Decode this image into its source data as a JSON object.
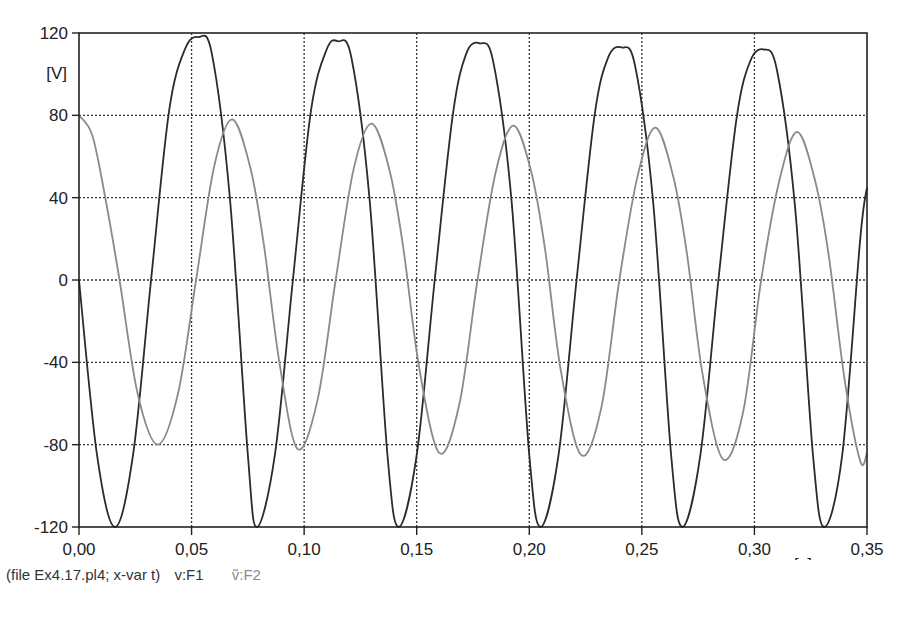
{
  "chart_data": {
    "type": "line",
    "title": "",
    "xlabel": "[s]",
    "ylabel": "[V]",
    "xlim": [
      0,
      0.35
    ],
    "ylim": [
      -120,
      120
    ],
    "grid": true,
    "grid_style": "dotted",
    "x_ticks": [
      0.0,
      0.05,
      0.1,
      0.15,
      0.2,
      0.25,
      0.3,
      0.35
    ],
    "x_tick_labels": [
      "0,00",
      "0,05",
      "0,10",
      "0,15",
      "0,20",
      "0,25",
      "0,30",
      "0,35"
    ],
    "y_ticks": [
      120,
      80,
      40,
      0,
      -40,
      -80,
      -120
    ],
    "y_tick_labels": [
      "120",
      "80",
      "40",
      "0",
      "-40",
      "-80",
      "-120"
    ],
    "legend_position": "bottom-left caption",
    "series": [
      {
        "name": "v:F1",
        "color": "#2b2b2b",
        "description": "sinusoid ~16 Hz starting at 0 going negative, amplitude ~118 V decaying slightly to ~112 V",
        "peaks": [
          [
            0.053,
            118
          ],
          [
            0.115,
            116
          ],
          [
            0.178,
            115
          ],
          [
            0.241,
            113
          ],
          [
            0.304,
            112
          ]
        ],
        "troughs": [
          [
            0.016,
            -120
          ],
          [
            0.079,
            -120
          ],
          [
            0.142,
            -120
          ],
          [
            0.205,
            -120
          ],
          [
            0.268,
            -120
          ],
          [
            0.331,
            -120
          ]
        ],
        "x": [
          0.0,
          0.008,
          0.016,
          0.024,
          0.032,
          0.04,
          0.047,
          0.053,
          0.059,
          0.067,
          0.075,
          0.079,
          0.087,
          0.095,
          0.103,
          0.11,
          0.115,
          0.121,
          0.129,
          0.137,
          0.142,
          0.15,
          0.158,
          0.166,
          0.172,
          0.178,
          0.184,
          0.192,
          0.2,
          0.205,
          0.213,
          0.221,
          0.229,
          0.235,
          0.241,
          0.247,
          0.255,
          0.263,
          0.268,
          0.276,
          0.284,
          0.292,
          0.298,
          0.304,
          0.31,
          0.318,
          0.326,
          0.331,
          0.339,
          0.347,
          0.35
        ],
        "values": [
          0,
          -85,
          -120,
          -85,
          0,
          82,
          112,
          118,
          110,
          40,
          -85,
          -120,
          -85,
          0,
          82,
          112,
          116,
          108,
          40,
          -85,
          -120,
          -85,
          0,
          80,
          110,
          115,
          106,
          40,
          -85,
          -120,
          -85,
          0,
          80,
          108,
          113,
          104,
          38,
          -85,
          -120,
          -85,
          0,
          78,
          106,
          112,
          102,
          36,
          -85,
          -120,
          -85,
          20,
          45
        ]
      },
      {
        "name": "v:F2",
        "color": "#8a8a8a",
        "description": "sinusoid ~16 Hz starting at +80 (cosine-like), peaks ~78→72 V, troughs ~-80→-88 V",
        "peaks": [
          [
            0.0,
            80
          ],
          [
            0.068,
            78
          ],
          [
            0.13,
            76
          ],
          [
            0.193,
            75
          ],
          [
            0.256,
            74
          ],
          [
            0.319,
            72
          ]
        ],
        "troughs": [
          [
            0.035,
            -80
          ],
          [
            0.097,
            -82
          ],
          [
            0.16,
            -84
          ],
          [
            0.223,
            -85
          ],
          [
            0.286,
            -87
          ],
          [
            0.347,
            -88
          ]
        ],
        "x": [
          0.0,
          0.006,
          0.012,
          0.018,
          0.026,
          0.035,
          0.044,
          0.052,
          0.06,
          0.068,
          0.076,
          0.082,
          0.089,
          0.097,
          0.106,
          0.114,
          0.122,
          0.13,
          0.138,
          0.144,
          0.151,
          0.16,
          0.169,
          0.177,
          0.185,
          0.193,
          0.201,
          0.207,
          0.214,
          0.223,
          0.232,
          0.24,
          0.248,
          0.256,
          0.264,
          0.27,
          0.277,
          0.286,
          0.295,
          0.303,
          0.311,
          0.319,
          0.327,
          0.333,
          0.34,
          0.347,
          0.35
        ],
        "values": [
          80,
          70,
          38,
          0,
          -55,
          -80,
          -55,
          0,
          55,
          78,
          55,
          18,
          -40,
          -82,
          -58,
          0,
          54,
          76,
          53,
          16,
          -42,
          -84,
          -60,
          0,
          52,
          75,
          52,
          15,
          -44,
          -85,
          -62,
          0,
          50,
          74,
          50,
          13,
          -46,
          -87,
          -64,
          0,
          48,
          72,
          48,
          12,
          -48,
          -88,
          -84
        ]
      }
    ]
  },
  "axes": {
    "y_unit": "[V]",
    "x_unit": "[s]"
  },
  "caption": {
    "file_info": "(file Ex4.17.pl4; x-var t)",
    "legend": [
      {
        "label": "v:F1",
        "color": "#2b2b2b"
      },
      {
        "label": "ṽ:F2",
        "color": "#8a8a8a"
      }
    ]
  }
}
